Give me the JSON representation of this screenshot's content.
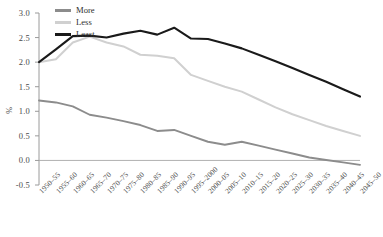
{
  "chart_data": {
    "type": "line",
    "title": "",
    "subtitle": "",
    "xlabel": "",
    "ylabel": "%",
    "ylim": [
      -0.5,
      3.0
    ],
    "ytick_values": [
      3.0,
      2.5,
      2.0,
      1.5,
      1.0,
      0.5,
      0.0,
      -0.5
    ],
    "ytick_labels": [
      "3.0",
      "2.5",
      "2.0",
      "1.5",
      "1.0",
      "0.5",
      "0.0",
      "-0.5"
    ],
    "grid": false,
    "legend_position": "top-left",
    "zero_line": true,
    "categories": [
      "1950–55",
      "1955–60",
      "1960–65",
      "1965–70",
      "1970–75",
      "1975–80",
      "1980–85",
      "1985–90",
      "1990–95",
      "1995–2000",
      "2000–05",
      "2005–10",
      "2010–15",
      "2015–20",
      "2020–25",
      "2025–30",
      "2030–35",
      "2035–40",
      "2040–45",
      "2045–50"
    ],
    "series": [
      {
        "name": "More",
        "color": "#8c8c8c",
        "values": [
          1.22,
          1.18,
          1.1,
          0.93,
          0.87,
          0.8,
          0.72,
          0.6,
          0.62,
          0.5,
          0.38,
          0.32,
          0.38,
          0.3,
          0.22,
          0.14,
          0.06,
          0.01,
          -0.04,
          -0.09
        ]
      },
      {
        "name": "Less",
        "color": "#d0d0d0",
        "values": [
          2.0,
          2.06,
          2.4,
          2.52,
          2.4,
          2.32,
          2.15,
          2.13,
          2.08,
          1.74,
          1.62,
          1.5,
          1.4,
          1.24,
          1.08,
          0.94,
          0.82,
          0.7,
          0.6,
          0.5
        ]
      },
      {
        "name": "Least",
        "color": "#1a1a1a",
        "values": [
          2.0,
          2.26,
          2.53,
          2.54,
          2.5,
          2.58,
          2.64,
          2.56,
          2.7,
          2.48,
          2.47,
          2.38,
          2.28,
          2.15,
          2.02,
          1.88,
          1.74,
          1.6,
          1.45,
          1.3
        ]
      }
    ]
  },
  "legend": {
    "items": [
      {
        "label": "More",
        "color": "#8c8c8c"
      },
      {
        "label": "Less",
        "color": "#d0d0d0"
      },
      {
        "label": "Least",
        "color": "#1a1a1a"
      }
    ]
  },
  "axis": {
    "y_axis_title": "%"
  },
  "caption": ""
}
